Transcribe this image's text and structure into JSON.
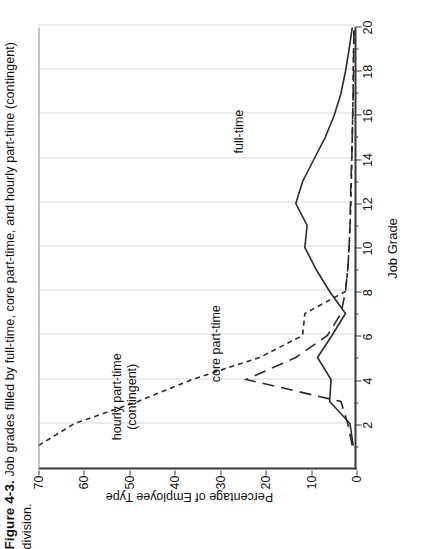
{
  "figure": {
    "number": "Figure 4-3.",
    "caption": "Job grades filled by full-time, core part-time, and hourly part-time (contingent)",
    "caption_line2": "division."
  },
  "chart_data": {
    "type": "line",
    "title": "",
    "xlabel": "Job Grade",
    "ylabel": "Percentage of Employee Type",
    "xlim": [
      0,
      20
    ],
    "ylim": [
      0,
      70
    ],
    "xticks": [
      2,
      4,
      6,
      8,
      10,
      12,
      14,
      16,
      18,
      20
    ],
    "xticklabels": [
      "2",
      "4",
      "6",
      "8",
      "10",
      "12",
      "14",
      "16",
      "18",
      "20"
    ],
    "yticks": [
      0,
      10,
      20,
      30,
      40,
      50,
      60,
      70
    ],
    "yticklabels": [
      "0",
      "10",
      "20",
      "30",
      "40",
      "50",
      "60",
      "70"
    ],
    "grid": "vertical",
    "legend_position": "inline-annotations",
    "x": [
      1,
      2,
      3,
      4,
      5,
      6,
      7,
      8,
      9,
      10,
      11,
      12,
      13,
      14,
      15,
      16,
      17,
      18,
      19,
      20
    ],
    "series": [
      {
        "name": "full-time",
        "label": "full-time",
        "linestyle": "solid",
        "color": "#2b2b2b",
        "values": [
          0.3,
          1.0,
          5.5,
          5.2,
          8.2,
          5.0,
          2.0,
          5.5,
          8.5,
          11.0,
          10.5,
          13.0,
          11.5,
          9.0,
          6.5,
          4.5,
          3.0,
          2.0,
          1.2,
          0.5
        ]
      },
      {
        "name": "core part-time",
        "label": "core part-time",
        "linestyle": "long-dash",
        "color": "#2b2b2b",
        "values": [
          0.5,
          1.5,
          3.0,
          24.0,
          13.0,
          6.0,
          3.0,
          2.0,
          1.5,
          1.2,
          1.0,
          0.9,
          0.8,
          0.6,
          0.5,
          0.4,
          0.3,
          0.2,
          0.2,
          0.1
        ]
      },
      {
        "name": "hourly part-time (contingent)",
        "label_line1": "hourly part-time",
        "label_line2": "(contingent)",
        "linestyle": "short-dash",
        "color": "#2b2b2b",
        "values": [
          70.0,
          62.0,
          48.0,
          36.0,
          21.0,
          11.5,
          11.0,
          2.0,
          1.5,
          1.2,
          1.0,
          0.8,
          0.7,
          0.6,
          0.5,
          0.4,
          0.3,
          0.3,
          0.2,
          0.1
        ]
      }
    ],
    "annotations": [
      {
        "text": "full-time",
        "x": 15.2,
        "y": 26
      },
      {
        "text": "core part-time",
        "x": 5.6,
        "y": 31
      },
      {
        "text": "hourly part-time (contingent)",
        "x": 3.2,
        "y": 51
      }
    ]
  }
}
